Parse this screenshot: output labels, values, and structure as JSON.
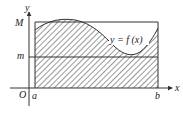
{
  "diagram": {
    "labels": {
      "y_axis": "y",
      "x_axis": "x",
      "origin": "O",
      "upper_bound": "M",
      "lower_bound": "m",
      "left_limit": "a",
      "right_limit": "b",
      "curve": "y = f (x)"
    },
    "colors": {
      "line": "#333333",
      "hatch": "#444444",
      "background": "#ffffff"
    }
  }
}
